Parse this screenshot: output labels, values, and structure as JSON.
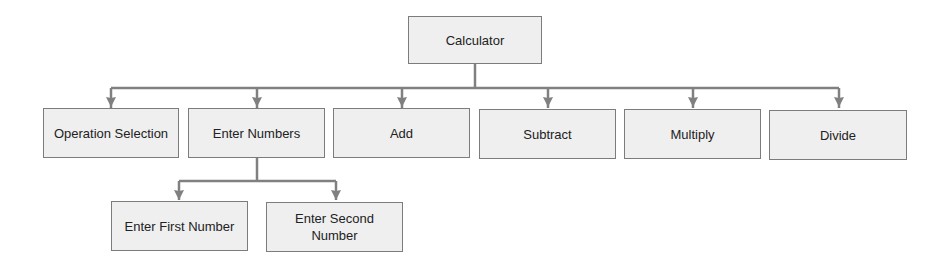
{
  "diagram": {
    "type": "tree",
    "colors": {
      "box_fill": "#efefef",
      "box_border": "#7c7c7c",
      "connector": "#808080",
      "text": "#222222"
    },
    "root": {
      "id": "calculator",
      "label": "Calculator"
    },
    "level1": [
      {
        "id": "operation-selection",
        "label": "Operation Selection"
      },
      {
        "id": "enter-numbers",
        "label": "Enter Numbers"
      },
      {
        "id": "add",
        "label": "Add"
      },
      {
        "id": "subtract",
        "label": "Subtract"
      },
      {
        "id": "multiply",
        "label": "Multiply"
      },
      {
        "id": "divide",
        "label": "Divide"
      }
    ],
    "level2": [
      {
        "id": "enter-first-number",
        "label": "Enter First Number",
        "parent": "enter-numbers"
      },
      {
        "id": "enter-second-number",
        "label": "Enter Second Number",
        "parent": "enter-numbers"
      }
    ],
    "edges": [
      [
        "calculator",
        "operation-selection"
      ],
      [
        "calculator",
        "enter-numbers"
      ],
      [
        "calculator",
        "add"
      ],
      [
        "calculator",
        "subtract"
      ],
      [
        "calculator",
        "multiply"
      ],
      [
        "calculator",
        "divide"
      ],
      [
        "enter-numbers",
        "enter-first-number"
      ],
      [
        "enter-numbers",
        "enter-second-number"
      ]
    ]
  }
}
